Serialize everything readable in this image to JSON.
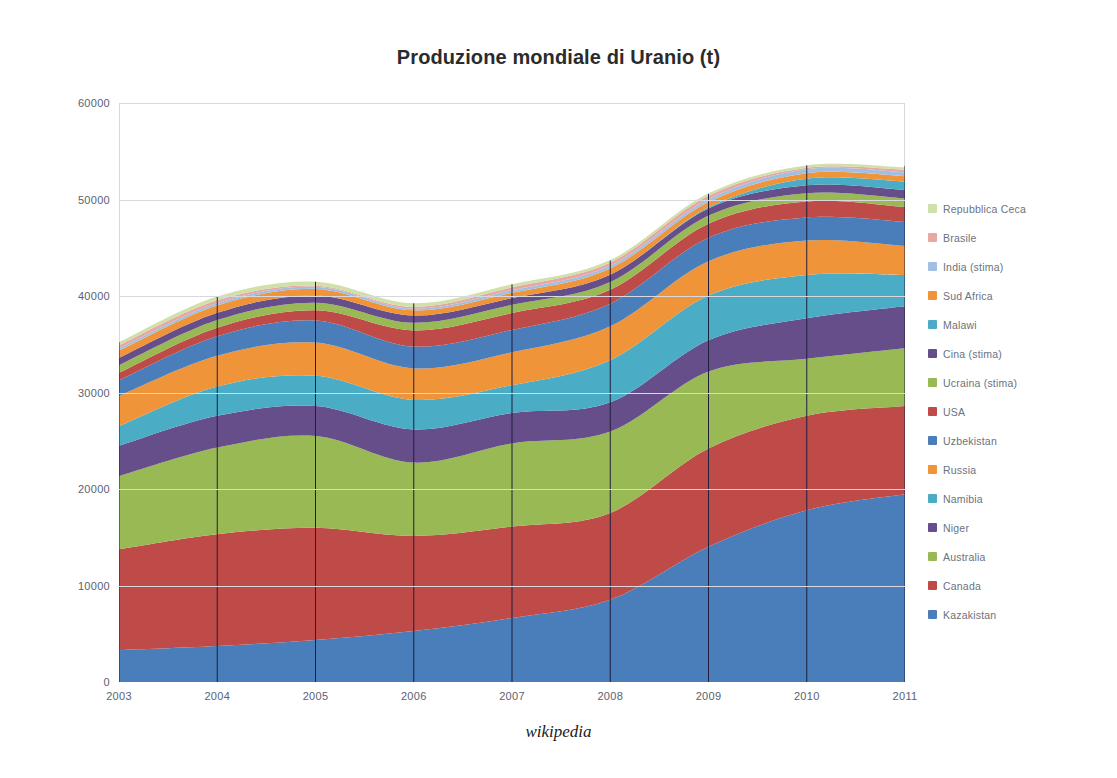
{
  "chart_data": {
    "type": "area",
    "stacked": true,
    "title": "Produzione mondiale di Uranio (t)",
    "xlabel": "",
    "ylabel": "",
    "source_note": "wikipedia",
    "grid": true,
    "legend_position": "right",
    "legend_order_top_to_bottom": [
      "Repubblica Ceca",
      "Brasile",
      "India (stima)",
      "Sud Africa",
      "Malawi",
      "Cina (stima)",
      "Ucraina (stima)",
      "USA",
      "Uzbekistan",
      "Russia",
      "Namibia",
      "Niger",
      "Australia",
      "Canada",
      "Kazakistan"
    ],
    "categories": [
      "2003",
      "2004",
      "2005",
      "2006",
      "2007",
      "2008",
      "2009",
      "2010",
      "2011"
    ],
    "x_tick_labels": [
      "2003",
      "2004",
      "2005",
      "2006",
      "2007",
      "2008",
      "2009",
      "2010",
      "2011"
    ],
    "y_tick_labels": [
      "0",
      "10000",
      "20000",
      "30000",
      "40000",
      "50000",
      "60000"
    ],
    "y_ticks": [
      0,
      10000,
      20000,
      30000,
      40000,
      50000,
      60000
    ],
    "ylim": [
      0,
      60000
    ],
    "series": [
      {
        "name": "Kazakistan",
        "color": "#4a7ebb",
        "values": [
          3300,
          3719,
          4357,
          5279,
          6637,
          8521,
          14020,
          17803,
          19451
        ]
      },
      {
        "name": "Canada",
        "color": "#be4b48",
        "values": [
          10457,
          11597,
          11628,
          9862,
          9476,
          9000,
          10173,
          9783,
          9145
        ]
      },
      {
        "name": "Australia",
        "color": "#98b954",
        "values": [
          7572,
          8982,
          9516,
          7593,
          8611,
          8430,
          7982,
          5900,
          5983
        ]
      },
      {
        "name": "Niger",
        "color": "#664e8b",
        "values": [
          3143,
          3282,
          3093,
          3434,
          3153,
          3032,
          3243,
          4198,
          4351
        ]
      },
      {
        "name": "Namibia",
        "color": "#4aacc5",
        "values": [
          2036,
          3038,
          3147,
          3067,
          2879,
          4366,
          4626,
          4496,
          3258
        ]
      },
      {
        "name": "Russia",
        "color": "#f09439",
        "values": [
          3150,
          3200,
          3431,
          3262,
          3413,
          3521,
          3564,
          3562,
          2993
        ]
      },
      {
        "name": "Uzbekistan",
        "color": "#4a7ebb",
        "values": [
          1598,
          2016,
          2300,
          2260,
          2320,
          2338,
          2429,
          2400,
          2500
        ]
      },
      {
        "name": "USA",
        "color": "#be4b48",
        "values": [
          779,
          878,
          1039,
          1672,
          1747,
          1430,
          1453,
          1660,
          1537
        ]
      },
      {
        "name": "Ucraina (stima)",
        "color": "#98b954",
        "values": [
          800,
          800,
          800,
          800,
          846,
          800,
          840,
          850,
          890
        ]
      },
      {
        "name": "Cina (stima)",
        "color": "#664e8b",
        "values": [
          750,
          750,
          750,
          750,
          712,
          769,
          750,
          827,
          885
        ]
      },
      {
        "name": "Malawi",
        "color": "#4aacc5",
        "values": [
          0,
          0,
          0,
          0,
          0,
          0,
          104,
          670,
          846
        ]
      },
      {
        "name": "Sud Africa",
        "color": "#f09439",
        "values": [
          758,
          755,
          674,
          534,
          539,
          655,
          563,
          583,
          582
        ]
      },
      {
        "name": "India (stima)",
        "color": "#9fc0e2",
        "values": [
          230,
          230,
          230,
          177,
          270,
          271,
          290,
          400,
          400
        ]
      },
      {
        "name": "Brasile",
        "color": "#e8a7a5",
        "values": [
          310,
          300,
          110,
          190,
          299,
          330,
          345,
          148,
          265
        ]
      },
      {
        "name": "Repubblica Ceca",
        "color": "#cfe0a8",
        "values": [
          345,
          412,
          408,
          359,
          306,
          263,
          258,
          254,
          229
        ]
      }
    ],
    "totals": [
      35228,
      39959,
      41483,
      39239,
      41208,
      43674,
      50571,
      53534,
      53493
    ]
  },
  "legend": {
    "items": [
      {
        "label": "Repubblica Ceca",
        "color": "#cfe0a8"
      },
      {
        "label": "Brasile",
        "color": "#e8a7a5"
      },
      {
        "label": "India (stima)",
        "color": "#9fc0e2"
      },
      {
        "label": "Sud Africa",
        "color": "#f09439"
      },
      {
        "label": "Malawi",
        "color": "#4aacc5"
      },
      {
        "label": "Cina (stima)",
        "color": "#664e8b"
      },
      {
        "label": "Ucraina (stima)",
        "color": "#98b954"
      },
      {
        "label": "USA",
        "color": "#be4b48"
      },
      {
        "label": "Uzbekistan",
        "color": "#4a7ebb"
      },
      {
        "label": "Russia",
        "color": "#f09439"
      },
      {
        "label": "Namibia",
        "color": "#4aacc5"
      },
      {
        "label": "Niger",
        "color": "#664e8b"
      },
      {
        "label": "Australia",
        "color": "#98b954"
      },
      {
        "label": "Canada",
        "color": "#be4b48"
      },
      {
        "label": "Kazakistan",
        "color": "#4a7ebb"
      }
    ]
  },
  "style": {
    "grid_color": "#d9d9dd",
    "axis_text_color": "#5a6270",
    "title_color": "#2b2b2b",
    "separator_color": "#1f1f3d"
  }
}
